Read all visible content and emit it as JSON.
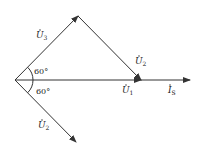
{
  "diagram": {
    "type": "phasor-diagram",
    "stroke_color": "#333333",
    "phasors": [
      {
        "id": "U3",
        "label": "U",
        "sub": "3",
        "from": [
          15,
          80
        ],
        "to": [
          78,
          16
        ]
      },
      {
        "id": "U2_top",
        "label": "U",
        "sub": "2",
        "from": [
          78,
          16
        ],
        "to": [
          141,
          80
        ]
      },
      {
        "id": "U1",
        "label": "U",
        "sub": "1",
        "from": [
          15,
          80
        ],
        "to": [
          141,
          80
        ]
      },
      {
        "id": "Is",
        "label": "I",
        "sub": "S",
        "from": [
          141,
          80
        ],
        "to": [
          190,
          80
        ]
      },
      {
        "id": "U2_bottom",
        "label": "U",
        "sub": "2",
        "from": [
          15,
          80
        ],
        "to": [
          76,
          142
        ]
      }
    ],
    "angles": [
      {
        "label": "60°",
        "position": "upper"
      },
      {
        "label": "60°",
        "position": "lower"
      }
    ]
  }
}
